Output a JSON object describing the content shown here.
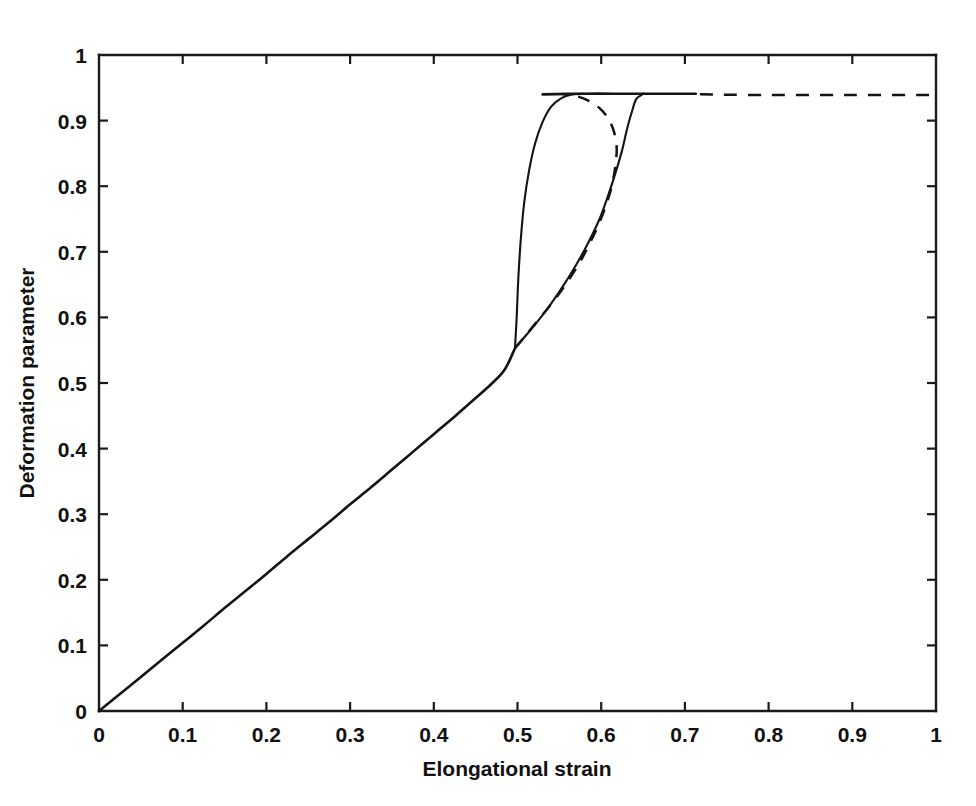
{
  "chart_data": {
    "type": "line",
    "title": "",
    "xlabel": "Elongational strain",
    "ylabel": "Deformation parameter",
    "xlim": [
      0,
      1
    ],
    "ylim": [
      0,
      1
    ],
    "xticks": [
      "0",
      "0.1",
      "0.2",
      "0.3",
      "0.4",
      "0.5",
      "0.6",
      "0.7",
      "0.8",
      "0.9",
      "1"
    ],
    "yticks": [
      "0",
      "0.1",
      "0.2",
      "0.3",
      "0.4",
      "0.5",
      "0.6",
      "0.7",
      "0.8",
      "0.9",
      "1"
    ],
    "xtick_values": [
      0,
      0.1,
      0.2,
      0.3,
      0.4,
      0.5,
      0.6,
      0.7,
      0.8,
      0.9,
      1
    ],
    "ytick_values": [
      0,
      0.1,
      0.2,
      0.3,
      0.4,
      0.5,
      0.6,
      0.7,
      0.8,
      0.9,
      1
    ],
    "grid": false,
    "legend": null,
    "plateau_value": 0.94,
    "branch_point": {
      "x": 0.497,
      "y": 0.553
    },
    "series": [
      {
        "name": "lower-stable-branch",
        "style": "solid",
        "points": [
          [
            0.0,
            0.0
          ],
          [
            0.025,
            0.026
          ],
          [
            0.05,
            0.052
          ],
          [
            0.075,
            0.078
          ],
          [
            0.1,
            0.104
          ],
          [
            0.125,
            0.13
          ],
          [
            0.15,
            0.157
          ],
          [
            0.175,
            0.183
          ],
          [
            0.2,
            0.209
          ],
          [
            0.225,
            0.236
          ],
          [
            0.25,
            0.262
          ],
          [
            0.275,
            0.288
          ],
          [
            0.3,
            0.315
          ],
          [
            0.325,
            0.341
          ],
          [
            0.35,
            0.368
          ],
          [
            0.375,
            0.395
          ],
          [
            0.4,
            0.422
          ],
          [
            0.425,
            0.449
          ],
          [
            0.45,
            0.477
          ],
          [
            0.47,
            0.5
          ],
          [
            0.485,
            0.521
          ],
          [
            0.497,
            0.553
          ]
        ]
      },
      {
        "name": "vertical-jump-to-plateau",
        "style": "solid",
        "points": [
          [
            0.497,
            0.553
          ],
          [
            0.499,
            0.6
          ],
          [
            0.501,
            0.66
          ],
          [
            0.504,
            0.72
          ],
          [
            0.508,
            0.775
          ],
          [
            0.514,
            0.825
          ],
          [
            0.521,
            0.865
          ],
          [
            0.53,
            0.898
          ],
          [
            0.54,
            0.921
          ],
          [
            0.552,
            0.934
          ],
          [
            0.565,
            0.94
          ],
          [
            0.58,
            0.941
          ]
        ]
      },
      {
        "name": "upper-plateau-solid",
        "style": "solid",
        "points": [
          [
            0.53,
            0.94
          ],
          [
            0.58,
            0.941
          ],
          [
            0.63,
            0.941
          ],
          [
            0.68,
            0.941
          ],
          [
            0.713,
            0.941
          ]
        ]
      },
      {
        "name": "upper-plateau-dashed",
        "style": "dashed",
        "points": [
          [
            0.718,
            0.94
          ],
          [
            0.8,
            0.939
          ],
          [
            0.9,
            0.939
          ],
          [
            1.0,
            0.939
          ]
        ]
      },
      {
        "name": "second-solid-rising-branch",
        "style": "solid",
        "points": [
          [
            0.497,
            0.553
          ],
          [
            0.515,
            0.58
          ],
          [
            0.535,
            0.612
          ],
          [
            0.553,
            0.645
          ],
          [
            0.57,
            0.68
          ],
          [
            0.585,
            0.715
          ],
          [
            0.598,
            0.75
          ],
          [
            0.608,
            0.785
          ],
          [
            0.617,
            0.82
          ],
          [
            0.625,
            0.855
          ],
          [
            0.631,
            0.888
          ],
          [
            0.637,
            0.915
          ],
          [
            0.642,
            0.933
          ],
          [
            0.6505,
            0.941
          ]
        ]
      },
      {
        "name": "unstable-dashed-branch",
        "style": "dashed",
        "points": [
          [
            0.497,
            0.553
          ],
          [
            0.512,
            0.576
          ],
          [
            0.528,
            0.601
          ],
          [
            0.545,
            0.628
          ],
          [
            0.56,
            0.655
          ],
          [
            0.574,
            0.683
          ],
          [
            0.586,
            0.712
          ],
          [
            0.597,
            0.742
          ],
          [
            0.606,
            0.772
          ],
          [
            0.613,
            0.802
          ],
          [
            0.617,
            0.832
          ],
          [
            0.6185,
            0.858
          ],
          [
            0.6155,
            0.882
          ],
          [
            0.6085,
            0.903
          ],
          [
            0.598,
            0.919
          ],
          [
            0.584,
            0.931
          ],
          [
            0.568,
            0.938
          ],
          [
            0.5535,
            0.9405
          ]
        ]
      }
    ]
  },
  "axes": {
    "x_title": "Elongational strain",
    "y_title": "Deformation parameter"
  }
}
